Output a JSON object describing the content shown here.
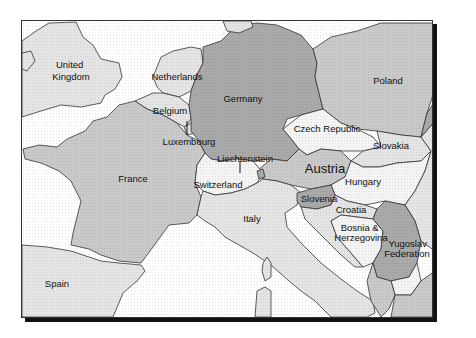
{
  "map": {
    "title": "Central Europe political map",
    "colors": {
      "sea": "#ffffff",
      "light": "#e4e4e4",
      "medium": "#c9c9c9",
      "dark": "#a9a9a9",
      "white_land": "#f4f4f4",
      "border": "#333333",
      "shadow": "#111111"
    },
    "countries": [
      {
        "id": "united-kingdom",
        "label_lines": [
          "United",
          "Kingdom"
        ],
        "shade": "light"
      },
      {
        "id": "netherlands",
        "label_lines": [
          "Netherlands"
        ],
        "shade": "light"
      },
      {
        "id": "belgium",
        "label_lines": [
          "Belgium"
        ],
        "shade": "light"
      },
      {
        "id": "luxembourg",
        "label_lines": [
          "Luxembourg"
        ],
        "shade": "light"
      },
      {
        "id": "germany",
        "label_lines": [
          "Germany"
        ],
        "shade": "dark"
      },
      {
        "id": "poland",
        "label_lines": [
          "Poland"
        ],
        "shade": "medium"
      },
      {
        "id": "czech-republic",
        "label_lines": [
          "Czech Republic"
        ],
        "shade": "white_land"
      },
      {
        "id": "slovakia",
        "label_lines": [
          "Slovakia"
        ],
        "shade": "light"
      },
      {
        "id": "liechtenstein",
        "label_lines": [
          "Liechtenstein"
        ],
        "shade": "dark"
      },
      {
        "id": "austria",
        "label_lines": [
          "Austria"
        ],
        "shade": "medium"
      },
      {
        "id": "france",
        "label_lines": [
          "France"
        ],
        "shade": "medium"
      },
      {
        "id": "switzerland",
        "label_lines": [
          "Switzerland"
        ],
        "shade": "white_land"
      },
      {
        "id": "hungary",
        "label_lines": [
          "Hungary"
        ],
        "shade": "white_land"
      },
      {
        "id": "italy",
        "label_lines": [
          "Italy"
        ],
        "shade": "light"
      },
      {
        "id": "slovenia",
        "label_lines": [
          "Slovenia"
        ],
        "shade": "dark"
      },
      {
        "id": "croatia",
        "label_lines": [
          "Croatia"
        ],
        "shade": "light"
      },
      {
        "id": "bosnia-herzegovina",
        "label_lines": [
          "Bosnia &",
          "Herzegovina"
        ],
        "shade": "white_land"
      },
      {
        "id": "yugoslav-federation",
        "label_lines": [
          "Yugoslav",
          "Federation"
        ],
        "shade": "dark"
      },
      {
        "id": "spain",
        "label_lines": [
          "Spain"
        ],
        "shade": "light"
      }
    ]
  }
}
